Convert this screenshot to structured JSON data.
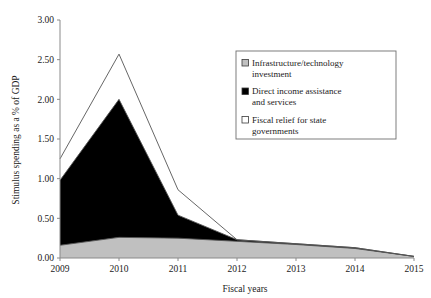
{
  "title": "",
  "chart_data": {
    "type": "area",
    "stacked": true,
    "title": "",
    "xlabel": "Fiscal years",
    "ylabel": "Stimulus spending as a % of GDP",
    "x": [
      2009,
      2010,
      2011,
      2012,
      2013,
      2014,
      2015
    ],
    "xticklabels": [
      "2009",
      "2010",
      "2011",
      "2012",
      "2013",
      "2014",
      "2015"
    ],
    "yticklabels": [
      "0.00",
      "0.50",
      "1.00",
      "1.50",
      "2.00",
      "2.50",
      "3.00"
    ],
    "yticks": [
      0.0,
      0.5,
      1.0,
      1.5,
      2.0,
      2.5,
      3.0
    ],
    "ylim": [
      0.0,
      3.0
    ],
    "xlim": [
      2009,
      2015
    ],
    "grid": false,
    "legend_position": "upper right",
    "series": [
      {
        "name": "Infrastructure/technology investment",
        "color": "#c0c0c0",
        "values": [
          0.16,
          0.26,
          0.25,
          0.21,
          0.17,
          0.12,
          0.02
        ]
      },
      {
        "name": "Direct income assistance and services",
        "color": "#000000",
        "values": [
          0.82,
          1.74,
          0.29,
          0.02,
          0.01,
          0.01,
          0.0
        ]
      },
      {
        "name": "Fiscal relief for state governments",
        "color": "#ffffff",
        "values": [
          0.27,
          0.57,
          0.32,
          0.0,
          0.0,
          0.0,
          0.0
        ]
      }
    ],
    "cumulative_tops": {
      "infrastructure": [
        0.16,
        0.26,
        0.25,
        0.21,
        0.17,
        0.12,
        0.02
      ],
      "direct_income": [
        0.98,
        2.0,
        0.54,
        0.23,
        0.18,
        0.13,
        0.02
      ],
      "fiscal_relief": [
        1.25,
        2.57,
        0.86,
        0.23,
        0.18,
        0.13,
        0.02
      ]
    }
  },
  "legend": {
    "items": [
      {
        "label_line1": "Infrastructure/technology",
        "label_line2": "investment",
        "swatch": "gray"
      },
      {
        "label_line1": "Direct income assistance",
        "label_line2": "and services",
        "swatch": "black"
      },
      {
        "label_line1": "Fiscal relief for state",
        "label_line2": "governments",
        "swatch": "white"
      }
    ]
  },
  "colors": {
    "infrastructure": "#c0c0c0",
    "direct_income": "#000000",
    "fiscal_relief": "#ffffff",
    "axis": "#8a8a8a",
    "outline": "#555555"
  }
}
